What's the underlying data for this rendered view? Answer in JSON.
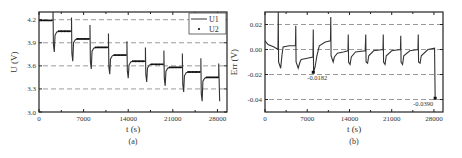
{
  "chart_data": [
    {
      "type": "line",
      "panel_label": "(a)",
      "title": "",
      "xlabel": "t (s)",
      "ylabel": "U (V)",
      "xlim": [
        0,
        29500
      ],
      "ylim": [
        3.0,
        4.3
      ],
      "xticks": [
        0,
        7000,
        14000,
        21000,
        28000
      ],
      "xtick_labels": [
        "0",
        "7000",
        "14000",
        "21000",
        "28000"
      ],
      "yticks": [
        3.0,
        3.3,
        3.6,
        3.9,
        4.2
      ],
      "ytick_labels": [
        "3.0",
        "3.3",
        "3.6",
        "3.9",
        "4.2"
      ],
      "grid": "horizontal dashed at 3.3, 3.6, 3.9, 4.2",
      "legend": {
        "position": "upper right",
        "entries": [
          "U1",
          "U2"
        ]
      },
      "series": [
        {
          "name": "U1",
          "style": "solid line",
          "step_starts": [
            0,
            2200,
            5100,
            8000,
            10900,
            13800,
            16700,
            19600,
            22500,
            25400
          ],
          "step_ends": [
            2200,
            5100,
            8000,
            10900,
            13800,
            16700,
            19600,
            22500,
            25400,
            28200
          ],
          "rest_voltages": [
            4.19,
            4.05,
            3.95,
            3.84,
            3.74,
            3.66,
            3.62,
            3.58,
            3.52,
            3.45
          ],
          "dip_voltages": [
            3.88,
            3.78,
            3.66,
            3.56,
            3.49,
            3.44,
            3.39,
            3.34,
            3.26,
            3.14
          ]
        },
        {
          "name": "U2",
          "style": "dots",
          "rest_voltages": [
            4.19,
            4.05,
            3.95,
            3.84,
            3.74,
            3.66,
            3.62,
            3.58,
            3.52,
            3.45
          ]
        }
      ]
    },
    {
      "type": "line",
      "panel_label": "(b)",
      "title": "",
      "xlabel": "t (s)",
      "ylabel": "Err (V)",
      "xlim": [
        0,
        29500
      ],
      "ylim": [
        -0.05,
        0.03
      ],
      "xticks": [
        0,
        7000,
        14000,
        21000,
        28000
      ],
      "xtick_labels": [
        "0",
        "7000",
        "14000",
        "21000",
        "28000"
      ],
      "yticks": [
        -0.04,
        -0.02,
        0.0,
        0.02
      ],
      "ytick_labels": [
        "-0.04",
        "-0.02",
        "0.00",
        "0.02"
      ],
      "grid": "horizontal dashed at -0.04, -0.02, 0.00, 0.02",
      "annotations": [
        {
          "x": 8000,
          "y": -0.0182,
          "text": "-0.0182"
        },
        {
          "x": 28200,
          "y": -0.039,
          "text": "-0.0390"
        }
      ],
      "series": [
        {
          "name": "Err",
          "x": [
            0,
            500,
            1500,
            2150,
            2200,
            2250,
            2600,
            2800,
            3000,
            4000,
            5050,
            5100,
            5150,
            5500,
            5800,
            6000,
            7000,
            7950,
            8000,
            8050,
            8300,
            8600,
            9000,
            10000,
            10850,
            10900,
            10950,
            11300,
            11500,
            12000,
            13000,
            13750,
            13800,
            13850,
            14100,
            14300,
            15000,
            16600,
            16700,
            16750,
            17000,
            17200,
            18000,
            19550,
            19600,
            19650,
            19900,
            20100,
            21000,
            22450,
            22500,
            22550,
            22800,
            23000,
            24000,
            25350,
            25400,
            25450,
            25700,
            25900,
            27000,
            28100,
            28200,
            28250
          ],
          "y": [
            0.007,
            0.004,
            0.002,
            0.0,
            0.03,
            -0.01,
            -0.015,
            -0.005,
            0.002,
            0.003,
            0.003,
            0.019,
            -0.01,
            -0.015,
            -0.01,
            -0.008,
            -0.007,
            -0.006,
            0.016,
            -0.018,
            -0.014,
            -0.005,
            0.003,
            0.006,
            0.007,
            0.026,
            -0.005,
            -0.01,
            -0.006,
            -0.003,
            -0.002,
            -0.001,
            0.012,
            -0.01,
            -0.012,
            -0.006,
            -0.002,
            -0.001,
            0.012,
            -0.01,
            -0.011,
            -0.005,
            -0.001,
            0.0,
            0.012,
            -0.01,
            -0.012,
            -0.005,
            -0.001,
            0.0,
            0.011,
            -0.01,
            -0.012,
            -0.005,
            -0.001,
            0.0,
            0.012,
            -0.01,
            -0.011,
            -0.005,
            0.0,
            0.001,
            -0.039,
            -0.039
          ]
        }
      ]
    }
  ]
}
